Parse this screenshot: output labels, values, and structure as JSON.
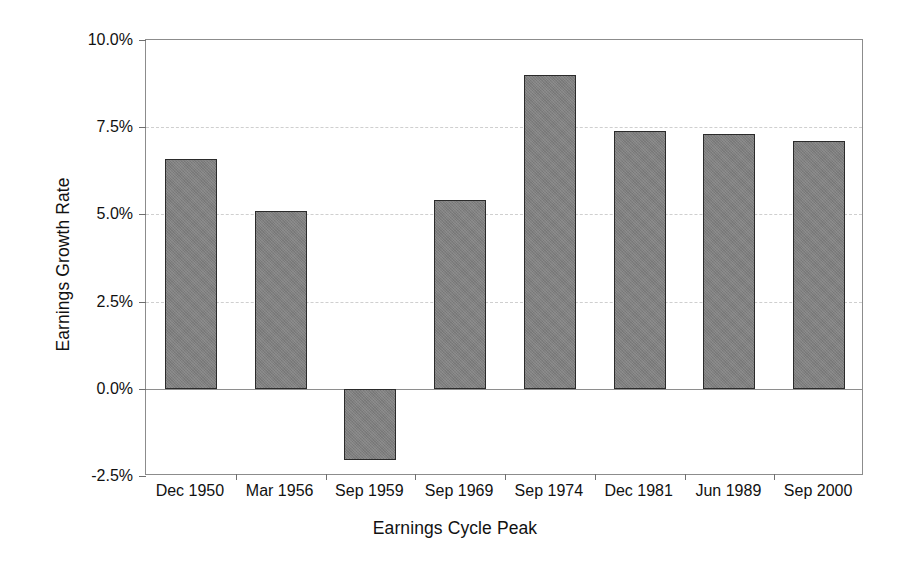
{
  "chart_data": {
    "type": "bar",
    "title": "",
    "xlabel": "Earnings Cycle Peak",
    "ylabel": "Earnings Growth Rate",
    "categories": [
      "Dec 1950",
      "Mar 1956",
      "Sep 1959",
      "Sep 1969",
      "Sep 1974",
      "Dec 1981",
      "Jun 1989",
      "Sep 2000"
    ],
    "values": [
      6.6,
      5.1,
      -2.05,
      5.4,
      9.0,
      7.4,
      7.3,
      7.1
    ],
    "value_unit": "percent",
    "ylim": [
      -2.5,
      10.0
    ],
    "ytick_values": [
      10.0,
      7.5,
      5.0,
      2.5,
      0.0,
      -2.5
    ],
    "ytick_labels": [
      "10.0%",
      "7.5%",
      "5.0%",
      "2.5%",
      "0.0%",
      "-2.5%"
    ],
    "grid": true,
    "grid_axis": "y",
    "legend": false,
    "legend_position": "none",
    "bar_fill_color": "#7f7f7f",
    "bar_edge_color": "#2b2b2b",
    "axis_color": "#8c8c8c",
    "gridline_color": "#cfcfcf",
    "background_color": "#ffffff"
  }
}
